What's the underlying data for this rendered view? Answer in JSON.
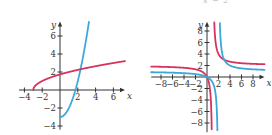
{
  "header_fragment": "x − 2",
  "colors": {
    "red": "#d6335e",
    "blue": "#3aa8d8",
    "axis": "#333333"
  },
  "chart_data": [
    {
      "type": "line",
      "title": "",
      "xlabel": "x",
      "ylabel": "y",
      "xlim": [
        -5,
        7.5
      ],
      "ylim": [
        -4.5,
        7.5
      ],
      "x_ticks": [
        -4,
        -2,
        2,
        4,
        6
      ],
      "y_ticks": [
        -4,
        -2,
        2,
        4,
        6
      ],
      "x_tick_labels": [
        "−4",
        "−2",
        "2",
        "4",
        "6"
      ],
      "y_tick_labels": [
        "−4",
        "−2",
        "2",
        "4",
        "6"
      ],
      "grid": false,
      "series": [
        {
          "name": "blue",
          "color": "#3aa8d8",
          "formula": "y = x^2 - 3, x >= 0",
          "x": [
            0,
            0.5,
            1,
            1.5,
            2,
            2.5,
            3,
            3.2
          ],
          "values": [
            -3,
            -2.75,
            -2,
            -0.75,
            1,
            3.25,
            6,
            7.24
          ]
        },
        {
          "name": "red",
          "color": "#d6335e",
          "formula": "y = sqrt(x + 3)",
          "x": [
            -3,
            -2.5,
            -2,
            -1,
            0,
            2,
            4,
            6,
            7.5
          ],
          "values": [
            0,
            0.71,
            1,
            1.41,
            1.73,
            2.24,
            2.65,
            3,
            3.24
          ]
        }
      ]
    },
    {
      "type": "line",
      "title": "",
      "xlabel": "x",
      "ylabel": "y",
      "xlim": [
        -10,
        10
      ],
      "ylim": [
        -9,
        10
      ],
      "x_ticks": [
        -8,
        -6,
        -4,
        -2,
        2,
        4,
        6,
        8
      ],
      "y_ticks": [
        -8,
        -6,
        -4,
        -2,
        2,
        4,
        6,
        8
      ],
      "x_tick_labels": [
        "−8",
        "−6",
        "−4",
        "−2",
        "2",
        "4",
        "6",
        "8"
      ],
      "y_tick_labels": [
        "−8",
        "−6",
        "−4",
        "−2",
        "2",
        "4",
        "6",
        "8"
      ],
      "grid": false,
      "series": [
        {
          "name": "red",
          "color": "#d6335e",
          "formula": "y = 2x/(x - 1)",
          "asymptotes": {
            "vertical": 1,
            "horizontal": 2
          }
        },
        {
          "name": "blue",
          "color": "#3aa8d8",
          "formula": "y = x/(x - 2)",
          "asymptotes": {
            "vertical": 2,
            "horizontal": 1
          }
        }
      ]
    }
  ]
}
